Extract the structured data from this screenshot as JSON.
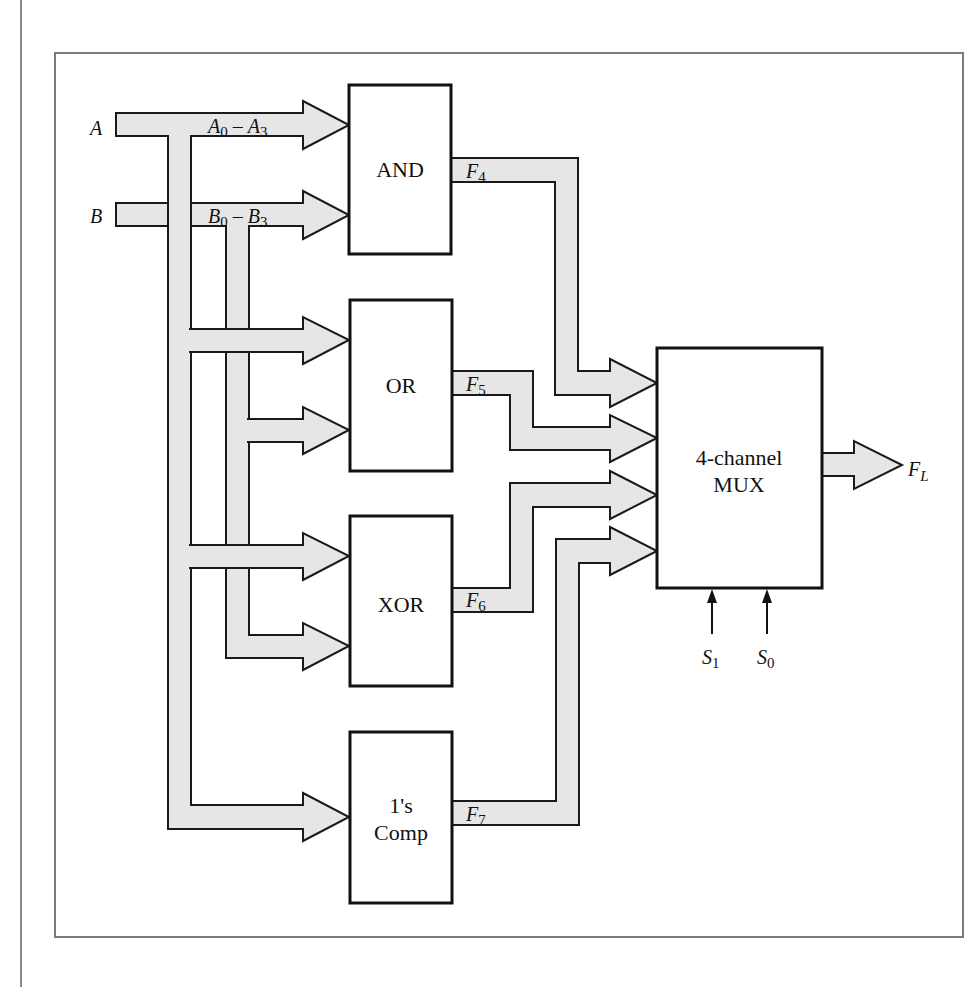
{
  "figure": {
    "colors": {
      "bus_fill": "#e6e6e6",
      "stroke": "#111111",
      "frame": "#7a7a7a"
    },
    "inputs": [
      {
        "name": "A",
        "bus_label": "A",
        "bus_label_sub0": "0",
        "bus_label_dash": " – ",
        "bus_label_end": "A",
        "bus_label_sub1": "3"
      },
      {
        "name": "B",
        "bus_label": "B",
        "bus_label_sub0": "0",
        "bus_label_dash": " – ",
        "bus_label_end": "B",
        "bus_label_sub1": "3"
      }
    ],
    "blocks": [
      {
        "id": "and",
        "label": "AND",
        "output": "F",
        "output_sub": "4"
      },
      {
        "id": "or",
        "label": "OR",
        "output": "F",
        "output_sub": "5"
      },
      {
        "id": "xor",
        "label": "XOR",
        "output": "F",
        "output_sub": "6"
      },
      {
        "id": "comp",
        "label_line1": "1's",
        "label_line2": "Comp",
        "output": "F",
        "output_sub": "7"
      }
    ],
    "mux": {
      "label_line1": "4-channel",
      "label_line2": "MUX",
      "output": "F",
      "output_sub": "L",
      "selects": [
        {
          "name": "S",
          "sub": "1"
        },
        {
          "name": "S",
          "sub": "0"
        }
      ]
    }
  }
}
